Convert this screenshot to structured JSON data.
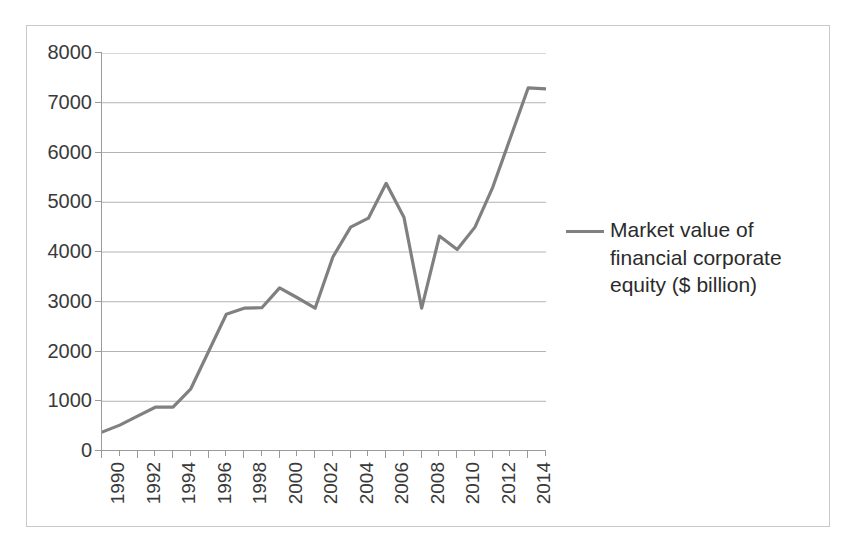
{
  "chart_data": {
    "type": "line",
    "title": "",
    "xlabel": "",
    "ylabel": "",
    "xlim": [
      1990,
      2015
    ],
    "ylim": [
      0,
      8000
    ],
    "ytick_step": 1000,
    "grid": true,
    "legend_position": "right",
    "legend": [
      "Market value of financial corporate equity ($ billion)"
    ],
    "series_color": "#808080",
    "ytick_labels": [
      "8000",
      "7000",
      "6000",
      "5000",
      "4000",
      "3000",
      "2000",
      "1000",
      "0"
    ],
    "xtick_labels": [
      "1990",
      "1992",
      "1994",
      "1996",
      "1998",
      "2000",
      "2002",
      "2004",
      "2006",
      "2008",
      "2010",
      "2012",
      "2014"
    ],
    "x": [
      1990,
      1991,
      1992,
      1993,
      1994,
      1995,
      1996,
      1997,
      1998,
      1999,
      2000,
      2001,
      2002,
      2003,
      2004,
      2005,
      2006,
      2007,
      2008,
      2009,
      2010,
      2011,
      2012,
      2013,
      2014,
      2015
    ],
    "series": [
      {
        "name": "Market value of financial corporate equity ($ billion)",
        "values": [
          380,
          520,
          700,
          880,
          880,
          1250,
          2000,
          2750,
          2870,
          2880,
          3280,
          3080,
          2870,
          3900,
          4500,
          4680,
          5380,
          4700,
          2870,
          4320,
          4050,
          4500,
          5300,
          6300,
          7300,
          7280
        ]
      }
    ]
  },
  "legend": {
    "label": "Market value of financial corporate equity ($ billion)"
  }
}
